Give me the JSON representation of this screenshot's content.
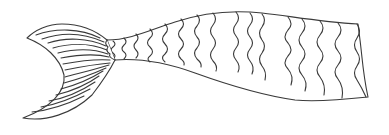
{
  "image": {
    "subject": "mermaid tail line drawing",
    "background": "#ffffff",
    "line_color": "#3a3a3a"
  },
  "drawing": {
    "parts": [
      {
        "name": "tail-fin",
        "description": "crescent-shaped fluke with curved parallel ribs"
      },
      {
        "name": "tail-body",
        "description": "tapering tail body covered in wavy scale rows"
      }
    ],
    "fin_rib_count": 15,
    "scale_row_count": 14
  }
}
